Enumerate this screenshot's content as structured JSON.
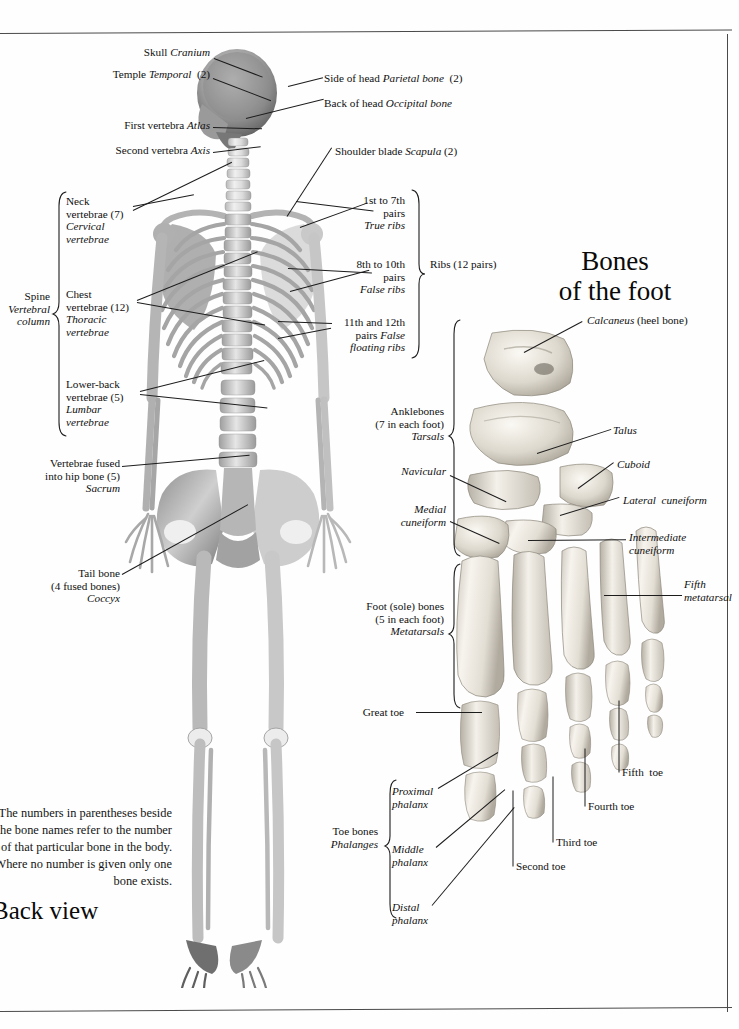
{
  "page": {
    "headings": {
      "foot": "Bones\nof the foot",
      "back_view": "Back view"
    },
    "note": "The numbers in parentheses beside\nthe bone names refer to the number\nof that particular bone in the body.\nWhere no number is given only one\nbone exists.",
    "page_number": ""
  },
  "skeleton_labels": {
    "skull": "Skull <i>Cranium</i>",
    "temple": "Temple <i>Temporal</i>  (2)",
    "first_vertebra": "First vertebra <i>Atlas</i>",
    "second_vertebra": "Second vertebra <i>Axis</i>",
    "side_of_head": "Side of head <i>Parietal bone</i>  (2)",
    "back_of_head": "Back of head <i>Occipital bone</i>",
    "shoulder_blade": "Shoulder blade <i>Scapula</i> (2)",
    "true_ribs": "1st to 7th\npairs\n<i>True ribs</i>",
    "false_ribs": "8th to 10th\npairs\n<i>False ribs</i>",
    "floating_ribs": "11th and 12th\npairs <i>False\nfloating ribs</i>",
    "ribs_total": "Ribs (12 pairs)",
    "cervical": "Neck\nvertebrae (7)\n<i>Cervical\nvertebrae</i>",
    "thoracic": "Chest\nvertebrae (12)\n<i>Thoracic\nvertebrae</i>",
    "lumbar": "Lower-back\nvertebrae (5)\n<i>Lumbar\nvertebrae</i>",
    "spine": "Spine\n<i>Vertebral\ncolumn</i>",
    "sacrum": "Vertebrae fused\ninto hip bone (5)\n<i>Sacrum</i>",
    "coccyx": "Tail bone\n(4 fused bones)\n<i>Coccyx</i>"
  },
  "foot_labels": {
    "calcaneus": "<i>Calcaneus</i> (heel bone)",
    "talus": "<i>Talus</i>",
    "cuboid": "<i>Cuboid</i>",
    "lateral_cuneiform": "<i>Lateral  cuneiform</i>",
    "intermediate_cuneiform": "<i>Intermediate\ncuneiform</i>",
    "navicular": "<i>Navicular</i>",
    "medial_cuneiform": "<i>Medial\ncuneiform</i>",
    "tarsals": "Anklebones\n(7 in each foot)\n<i>Tarsals</i>",
    "metatarsals": "Foot (sole) bones\n(5 in each foot)\n<i>Metatarsals</i>",
    "fifth_metatarsal": "<i>Fifth\nmetatarsal</i>",
    "great_toe": "Great toe",
    "second_toe": "Second toe",
    "third_toe": "Third toe",
    "fourth_toe": "Fourth toe",
    "fifth_toe": "Fifth  toe",
    "phalanges": "Toe bones\n<i>Phalanges</i>",
    "proximal_phalanx": "<i>Proximal\nphalanx</i>",
    "middle_phalanx": "<i>Middle\nphalanx</i>",
    "distal_phalanx": "<i>Distal\nphalanx</i>"
  },
  "colors": {
    "ink": "#101010",
    "rule": "#4a4a4a",
    "bone_light": "#f2efe9",
    "bone_mid": "#cfc9bf",
    "bone_dark": "#9a948a",
    "skeleton_gray": "#8d8d8d"
  }
}
